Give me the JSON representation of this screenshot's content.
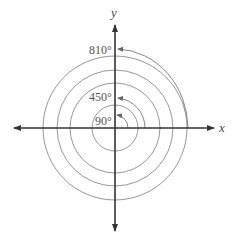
{
  "diagram": {
    "title": "",
    "axes": {
      "x_label": "x",
      "y_label": "y"
    },
    "angles": [
      {
        "label": "90°",
        "degrees": 90
      },
      {
        "label": "450°",
        "degrees": 450
      },
      {
        "label": "810°",
        "degrees": 810
      }
    ],
    "colors": {
      "axis": "#333333",
      "circle": "#8a8a8a",
      "text": "#555555"
    }
  }
}
